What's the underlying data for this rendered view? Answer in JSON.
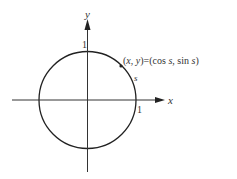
{
  "diagram": {
    "type": "unit-circle",
    "colors": {
      "stroke": "#222222",
      "text": "#333333",
      "background": "#ffffff"
    },
    "axes": {
      "x_label": "x",
      "y_label": "y",
      "x_tick_label": "1",
      "y_tick_label": "1"
    },
    "point": {
      "label": "(x, y) = (cos s, sin s)",
      "label_parts": {
        "open": "(",
        "x": "x",
        "comma": ", ",
        "y": "y",
        "eq": ")=(cos ",
        "s1": "s",
        "mid": ",  sin ",
        "s2": "s",
        "close": ")"
      }
    },
    "arc_label": "s"
  }
}
